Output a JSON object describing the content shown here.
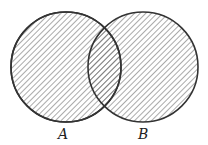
{
  "diagram": {
    "type": "venn",
    "sets": [
      {
        "label": "A",
        "cx": 66,
        "cy": 67,
        "r": 55,
        "shaded": true
      },
      {
        "label": "B",
        "cx": 143,
        "cy": 67,
        "r": 55,
        "shaded": true
      }
    ],
    "shading": "diagonal-hatch",
    "stroke_color": "#333333",
    "hatch_color": "#555555"
  }
}
